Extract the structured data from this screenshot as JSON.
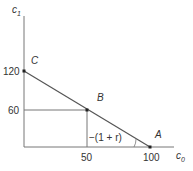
{
  "diagram": {
    "type": "budget-constraint",
    "axes": {
      "x_label": "c",
      "x_label_sub": "0",
      "y_label": "c",
      "y_label_sub": "1"
    },
    "ticks": {
      "y": [
        "120",
        "60"
      ],
      "x": [
        "50",
        "100"
      ]
    },
    "points": [
      {
        "name": "C",
        "c0": 0,
        "c1": 120
      },
      {
        "name": "B",
        "c0": 50,
        "c1": 60
      },
      {
        "name": "A",
        "c0": 100,
        "c1": 0
      }
    ],
    "slope_label": "−(1 + r)",
    "colors": {
      "line": "#555555",
      "guide": "#777777",
      "point": "#222222",
      "text": "#333333"
    }
  }
}
